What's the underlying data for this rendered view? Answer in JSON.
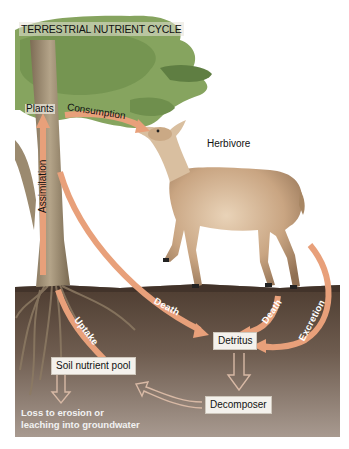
{
  "diagram": {
    "title": "TERRESTRIAL NUTRIENT CYCLE",
    "organisms": {
      "plants": "Plants",
      "herbivore": "Herbivore"
    },
    "nodes": {
      "detritus": "Detritus",
      "soil_pool": "Soil nutrient pool",
      "decomposer": "Decomposer"
    },
    "flows": {
      "consumption": "Consumption",
      "assimilation": "Assimilation",
      "death_plant": "Death",
      "death_herbivore": "Death",
      "excretion": "Excretion",
      "uptake": "Uptake"
    },
    "loss": {
      "line1": "Loss to erosion or",
      "line2": "leaching into groundwater"
    },
    "colors": {
      "arrow": "#e8a07a",
      "arrow_light": "#f0c8a8",
      "foliage": "#7f9f5a",
      "trunk": "#9b8a6f",
      "soil_top": "#5e4a3a",
      "soil_bottom": "#a39387",
      "ground_surface": "#4a3a2f",
      "sky": "#ffffff"
    }
  }
}
